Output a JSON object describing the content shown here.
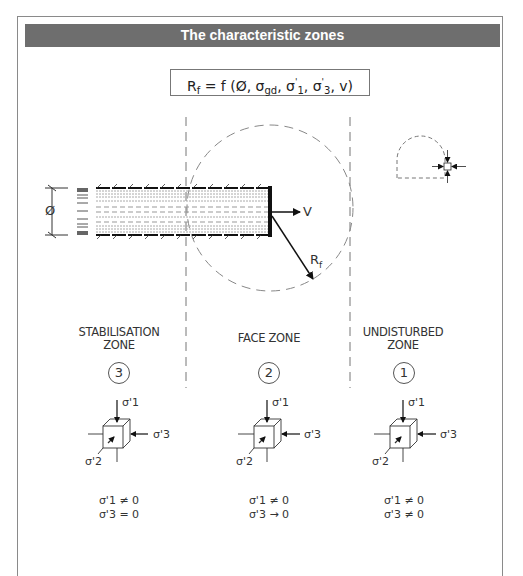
{
  "title": "The characteristic zones",
  "formula": {
    "lhs": "R",
    "lhs_sub": "f",
    "rhs": "= f (Ø, σgd, σ'1, σ'3, v)",
    "parts": [
      "= f (Ø, σ",
      "gd",
      ", σ",
      "'",
      "1",
      ", σ",
      "'",
      "3",
      ", v)"
    ]
  },
  "tunnel": {
    "diameter_label": "Ø",
    "velocity_label": "V",
    "radius_label": "R",
    "radius_sub": "f"
  },
  "zones": [
    {
      "id": 3,
      "name": "STABILISATION ZONE",
      "line1": "STABILISATION",
      "line2": "ZONE",
      "number": "3",
      "sigma1_label": "σ'1",
      "sigma2_label": "σ'2",
      "sigma3_label": "σ'3",
      "condition1": "σ'1 ≠ 0",
      "condition2": "σ'3 = 0"
    },
    {
      "id": 2,
      "name": "FACE ZONE",
      "line1": "FACE ZONE",
      "line2": "",
      "number": "2",
      "sigma1_label": "σ'1",
      "sigma2_label": "σ'2",
      "sigma3_label": "σ'3",
      "condition1": "σ'1 ≠ 0",
      "condition2": "σ'3 → 0"
    },
    {
      "id": 1,
      "name": "UNDISTURBED ZONE",
      "line1": "UNDISTURBED",
      "line2": "ZONE",
      "number": "1",
      "sigma1_label": "σ'1",
      "sigma2_label": "σ'2",
      "sigma3_label": "σ'3",
      "condition1": "σ'1 ≠ 0",
      "condition2": "σ'3 ≠ 0"
    }
  ],
  "colors": {
    "title_bar": "#6e6e6e",
    "title_text": "#ffffff",
    "lines": "#222222",
    "dashed": "#888888"
  }
}
